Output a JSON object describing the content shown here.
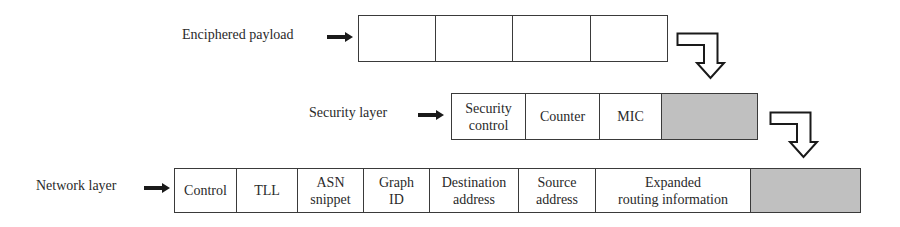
{
  "diagram": {
    "rows": [
      {
        "id": "enciphered",
        "label": "Enciphered payload",
        "cells": [
          {
            "text": "",
            "shaded": false
          },
          {
            "text": "",
            "shaded": false
          },
          {
            "text": "",
            "shaded": false
          },
          {
            "text": "",
            "shaded": false
          }
        ]
      },
      {
        "id": "security",
        "label": "Security layer",
        "cells": [
          {
            "text": "Security\ncontrol",
            "shaded": false
          },
          {
            "text": "Counter",
            "shaded": false
          },
          {
            "text": "MIC",
            "shaded": false
          },
          {
            "text": "",
            "shaded": true
          }
        ]
      },
      {
        "id": "network",
        "label": "Network layer",
        "cells": [
          {
            "text": "Control",
            "shaded": false
          },
          {
            "text": "TLL",
            "shaded": false
          },
          {
            "text": "ASN\nsnippet",
            "shaded": false
          },
          {
            "text": "Graph\nID",
            "shaded": false
          },
          {
            "text": "Destination\naddress",
            "shaded": false
          },
          {
            "text": "Source\naddress",
            "shaded": false
          },
          {
            "text": "Expanded\nrouting information",
            "shaded": false
          },
          {
            "text": "",
            "shaded": true
          }
        ]
      }
    ],
    "colors": {
      "border": "#3a3a3a",
      "shaded_fill": "#c0c0c0",
      "arrow": "#1a1a1a"
    },
    "icons": [
      "right-arrow-icon",
      "elbow-down-arrow-icon"
    ]
  }
}
